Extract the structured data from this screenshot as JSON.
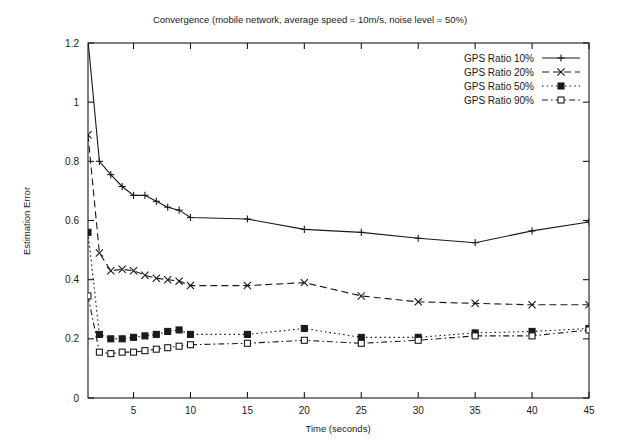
{
  "chart_data": {
    "type": "line",
    "title": "Convergence (mobile network, average speed = 10m/s, noise level = 50%)",
    "xlabel": "Time (seconds)",
    "ylabel": "Estimation Error",
    "xlim": [
      1,
      45
    ],
    "ylim": [
      0,
      1.2
    ],
    "xticks": [
      5,
      10,
      15,
      20,
      25,
      30,
      35,
      40,
      45
    ],
    "xtick_labels": [
      "5",
      "10",
      "15",
      "20",
      "25",
      "30",
      "35",
      "40",
      "45"
    ],
    "yticks": [
      0,
      0.2,
      0.4,
      0.6,
      0.8,
      1,
      1.2
    ],
    "ytick_labels": [
      "0",
      "0.2",
      "0.4",
      "0.6",
      "0.8",
      "1",
      "1.2"
    ],
    "grid": false,
    "legend_position": "top-right",
    "series": [
      {
        "name": "GPS Ratio 10%",
        "line_style": "solid",
        "marker": "plus",
        "x": [
          1,
          2,
          3,
          4,
          5,
          6,
          7,
          8,
          9,
          10,
          15,
          20,
          25,
          30,
          35,
          40,
          45
        ],
        "y": [
          1.21,
          0.8,
          0.755,
          0.715,
          0.685,
          0.685,
          0.665,
          0.645,
          0.635,
          0.61,
          0.605,
          0.57,
          0.56,
          0.54,
          0.525,
          0.565,
          0.595
        ]
      },
      {
        "name": "GPS Ratio 20%",
        "line_style": "dashed",
        "marker": "cross",
        "x": [
          1,
          2,
          3,
          4,
          5,
          6,
          7,
          8,
          9,
          10,
          15,
          20,
          25,
          30,
          35,
          40,
          45
        ],
        "y": [
          0.89,
          0.49,
          0.43,
          0.435,
          0.43,
          0.415,
          0.405,
          0.4,
          0.395,
          0.38,
          0.38,
          0.39,
          0.345,
          0.325,
          0.32,
          0.315,
          0.315
        ]
      },
      {
        "name": "GPS Ratio 50%",
        "line_style": "dotted",
        "marker": "filled-square",
        "x": [
          1,
          2,
          3,
          4,
          5,
          6,
          7,
          8,
          9,
          10,
          15,
          20,
          25,
          30,
          35,
          40,
          45
        ],
        "y": [
          0.56,
          0.215,
          0.2,
          0.2,
          0.205,
          0.21,
          0.215,
          0.225,
          0.23,
          0.215,
          0.215,
          0.235,
          0.205,
          0.205,
          0.22,
          0.225,
          0.235
        ]
      },
      {
        "name": "GPS Ratio 90%",
        "line_style": "dash-dot",
        "marker": "open-square",
        "x": [
          1,
          2,
          3,
          4,
          5,
          6,
          7,
          8,
          9,
          10,
          15,
          20,
          25,
          30,
          35,
          40,
          45
        ],
        "y": [
          0.345,
          0.155,
          0.15,
          0.155,
          0.155,
          0.16,
          0.165,
          0.17,
          0.175,
          0.18,
          0.185,
          0.195,
          0.185,
          0.195,
          0.21,
          0.21,
          0.23
        ]
      }
    ]
  }
}
